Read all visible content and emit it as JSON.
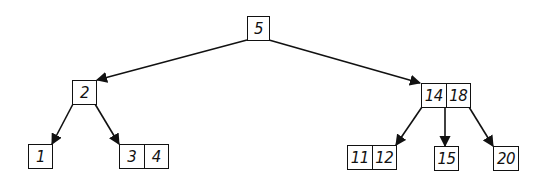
{
  "diagram": {
    "type": "tree",
    "title": "",
    "stroke_color": "#111111",
    "nodes": {
      "root": {
        "keys": [
          "5"
        ]
      },
      "left": {
        "keys": [
          "2"
        ]
      },
      "right": {
        "keys": [
          "14",
          "18"
        ]
      },
      "leaf_1": {
        "keys": [
          "1"
        ]
      },
      "leaf_3_4": {
        "keys": [
          "3",
          "4"
        ]
      },
      "leaf_11_12": {
        "keys": [
          "11",
          "12"
        ]
      },
      "leaf_15": {
        "keys": [
          "15"
        ]
      },
      "leaf_20": {
        "keys": [
          "20"
        ]
      }
    },
    "edges": [
      {
        "from": "root",
        "to": "left"
      },
      {
        "from": "root",
        "to": "right"
      },
      {
        "from": "left",
        "to": "leaf_1"
      },
      {
        "from": "left",
        "to": "leaf_3_4"
      },
      {
        "from": "right",
        "to": "leaf_11_12"
      },
      {
        "from": "right",
        "to": "leaf_15"
      },
      {
        "from": "right",
        "to": "leaf_20"
      }
    ]
  }
}
